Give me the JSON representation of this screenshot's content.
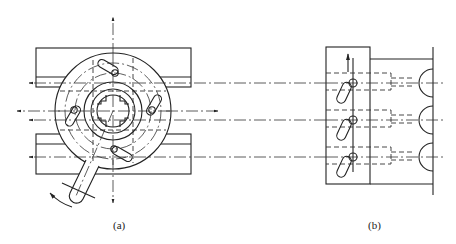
{
  "figure": {
    "panels": [
      {
        "id": "a",
        "label": "(a)",
        "description": "Top view of rotary indexing fixture with circular plate, four diagonal slots with pins, cross-shaped central bore and lever handle between two guide blocks; arrows indicate four radial directions and handle rotation"
      },
      {
        "id": "b",
        "label": "(b)",
        "description": "Side view of block with three inclined slots and pins driving three plungers with semicircular heads; arrows indicate leftward motion and upward movement"
      }
    ]
  }
}
